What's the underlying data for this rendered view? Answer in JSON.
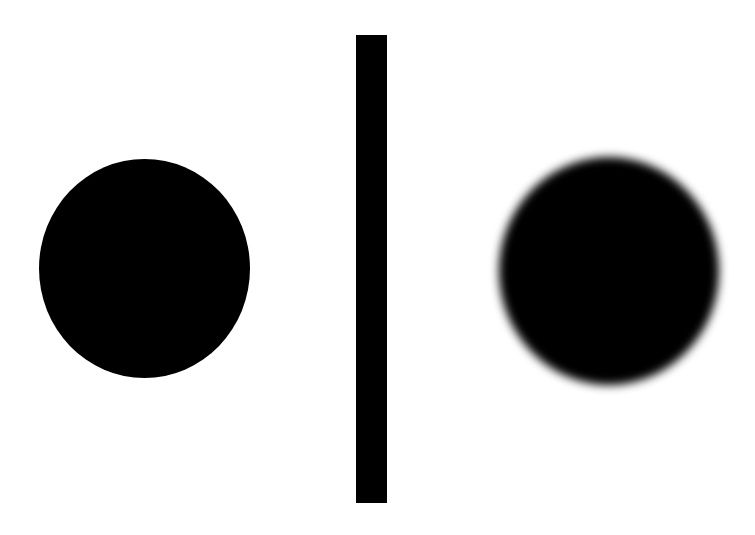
{
  "figure": {
    "background": "#ffffff",
    "foreground": "#000000",
    "elements": [
      {
        "name": "sharp-circle",
        "edge": "sharp"
      },
      {
        "name": "vertical-divider-bar"
      },
      {
        "name": "blurred-circle",
        "edge": "blurred"
      }
    ]
  }
}
